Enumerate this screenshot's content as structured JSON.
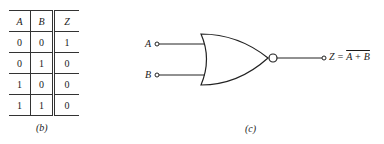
{
  "truth_table": {
    "headers": [
      "A",
      "B",
      "Z"
    ],
    "rows": [
      [
        "0",
        "0",
        "1"
      ],
      [
        "0",
        "1",
        "0"
      ],
      [
        "1",
        "0",
        "0"
      ],
      [
        "1",
        "1",
        "0"
      ]
    ],
    "caption": "(b)"
  },
  "gate_diagram": {
    "gate_type": "NOR",
    "input_a_label": "A",
    "input_b_label": "B",
    "output_prefix": "Z = ",
    "output_expr": "A + B",
    "caption": "(c)"
  }
}
